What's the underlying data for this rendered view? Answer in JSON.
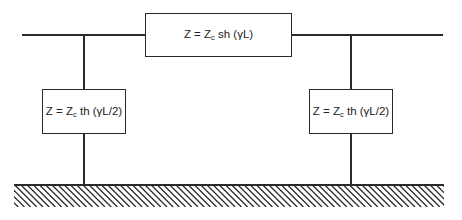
{
  "diagram": {
    "type": "pi-equivalent-circuit",
    "series_impedance": {
      "prefix": "Z = Z",
      "subscript": "c",
      "suffix": " sh (γL)"
    },
    "shunt_left": {
      "prefix": "Z = Z",
      "subscript": "c",
      "suffix": " th (γL/2)"
    },
    "shunt_right": {
      "prefix": "Z = Z",
      "subscript": "c",
      "suffix": " th (γL/2)"
    },
    "ground": "hatched-ground-plane",
    "colors": {
      "line": "#2a2a2a",
      "background": "#ffffff"
    }
  }
}
